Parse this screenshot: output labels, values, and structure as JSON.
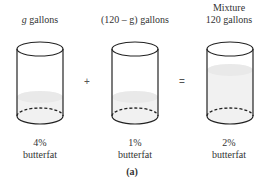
{
  "containers": [
    {
      "top_label_line1": "",
      "top_label_var": "g",
      "top_label": " gallons",
      "percent": "4%",
      "substance": "butterfat"
    },
    {
      "top_label_line1": "",
      "top_label_var": "",
      "top_label": "(120 – g) gallons",
      "percent": "1%",
      "substance": "butterfat"
    },
    {
      "top_label_line1": "Mixture",
      "top_label_var": "",
      "top_label": "120 gallons",
      "percent": "2%",
      "substance": "butterfat"
    }
  ],
  "operators": {
    "plus": "+",
    "equals": "="
  },
  "caption": "(a)"
}
